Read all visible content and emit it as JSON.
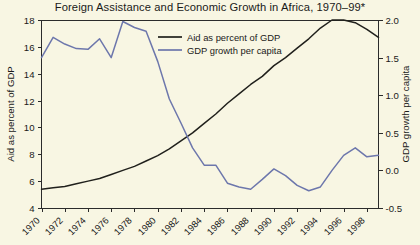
{
  "chart_data": {
    "type": "line",
    "title": "Foreign Assistance and Economic Growth in Africa, 1970–99*",
    "xlabel": "",
    "ylabel": "Aid as percent of GDP",
    "y2label": "GDP growth per capita",
    "grid": false,
    "legend_position": "top-center",
    "x": [
      1970,
      1971,
      1972,
      1973,
      1974,
      1975,
      1976,
      1977,
      1978,
      1979,
      1980,
      1981,
      1982,
      1983,
      1984,
      1985,
      1986,
      1987,
      1988,
      1989,
      1990,
      1991,
      1992,
      1993,
      1994,
      1995,
      1996,
      1997,
      1998,
      1999
    ],
    "xtick_labels": [
      "1970",
      "1972",
      "1974",
      "1976",
      "1978",
      "1980",
      "1982",
      "1984",
      "1986",
      "1988",
      "1990",
      "1992",
      "1994",
      "1996",
      "1998"
    ],
    "xlim": [
      1970,
      1999
    ],
    "ylim": [
      4,
      18
    ],
    "ytick_labels": [
      "4",
      "6",
      "8",
      "10",
      "12",
      "14",
      "16",
      "18"
    ],
    "ytick_values": [
      4,
      6,
      8,
      10,
      12,
      14,
      16,
      18
    ],
    "y2lim": [
      -0.5,
      2.0
    ],
    "y2tick_labels": [
      "-0.5",
      "0.0",
      "0.5",
      "1.0",
      "1.5",
      "2.0"
    ],
    "y2tick_values": [
      -0.5,
      0.0,
      0.5,
      1.0,
      1.5,
      2.0
    ],
    "series": [
      {
        "name": "Aid as percent of GDP",
        "axis": "left",
        "color": "#20201c",
        "values": [
          5.4,
          5.5,
          5.6,
          5.8,
          6.0,
          6.2,
          6.5,
          6.8,
          7.1,
          7.5,
          7.9,
          8.4,
          9.0,
          9.6,
          10.3,
          11.0,
          11.8,
          12.5,
          13.2,
          13.8,
          14.6,
          15.2,
          15.9,
          16.6,
          17.4,
          18.0,
          18.0,
          17.8,
          17.3,
          16.7
        ]
      },
      {
        "name": "GDP growth per capita",
        "axis": "right",
        "color": "#6d77ac",
        "values": [
          1.5,
          1.77,
          1.68,
          1.62,
          1.61,
          1.75,
          1.5,
          1.98,
          1.9,
          1.85,
          1.45,
          0.95,
          0.63,
          0.3,
          0.07,
          0.07,
          -0.17,
          -0.22,
          -0.25,
          -0.12,
          0.02,
          -0.07,
          -0.2,
          -0.27,
          -0.22,
          0.0,
          0.2,
          0.3,
          0.18,
          0.2
        ]
      }
    ]
  },
  "legend": {
    "items": [
      {
        "label": "Aid as percent of GDP",
        "color": "#20201c"
      },
      {
        "label": "GDP growth per capita",
        "color": "#6d77ac"
      }
    ]
  }
}
